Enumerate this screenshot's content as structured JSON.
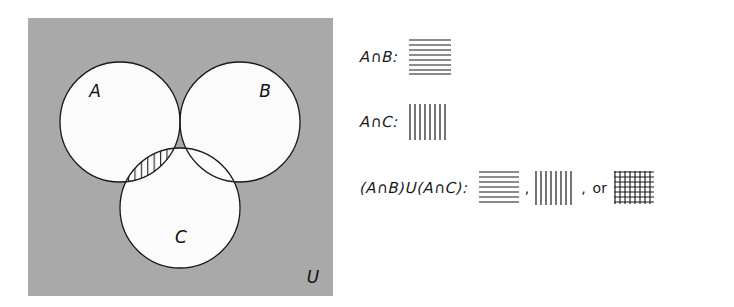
{
  "figure": {
    "type": "venn-diagram-3-set",
    "universe_label": "U",
    "universe_fill": "#a9a9a9",
    "circle_fill": "#fbfbfb",
    "stroke_color": "#1a1a1a",
    "sets": [
      {
        "label": "A",
        "position": "upper-left"
      },
      {
        "label": "B",
        "position": "upper-right"
      },
      {
        "label": "C",
        "position": "bottom-center"
      }
    ],
    "shaded_regions": [
      {
        "region": "A-and-B-only",
        "pattern": "horizontal-lines"
      },
      {
        "region": "A-and-C-only",
        "pattern": "vertical-lines"
      },
      {
        "region": "A-and-B-and-C",
        "pattern": "cross-hatch"
      }
    ]
  },
  "legend": {
    "rows": [
      {
        "expression": "A∩B:",
        "expression_parts": [
          "A",
          "∩",
          "B",
          ":"
        ],
        "patterns": [
          "horizontal-lines"
        ]
      },
      {
        "expression": "A∩C:",
        "expression_parts": [
          "A",
          "∩",
          "C",
          ":"
        ],
        "patterns": [
          "vertical-lines"
        ]
      },
      {
        "expression": "(A∩B)U(A∩C):",
        "expression_parts": [
          "(",
          "A",
          "∩",
          "B",
          ")",
          "U",
          "(",
          "A",
          "∩",
          "C",
          ")",
          ":"
        ],
        "patterns": [
          "horizontal-lines",
          "vertical-lines",
          "cross-hatch"
        ],
        "separator": ",",
        "or_word": "or"
      }
    ]
  }
}
